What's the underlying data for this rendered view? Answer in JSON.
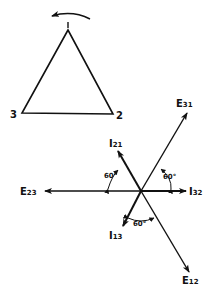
{
  "triangle": {
    "vertex_top_label": "",
    "vertex_left_label": "3",
    "vertex_right_label": "2",
    "rotation": "counter-clockwise"
  },
  "phasors": {
    "E23": {
      "main": "E",
      "sub": "23",
      "angle_deg": 180
    },
    "I32": {
      "main": "I",
      "sub": "32",
      "angle_deg": 0
    },
    "E31": {
      "main": "E",
      "sub": "31",
      "angle_deg": 60
    },
    "E12": {
      "main": "E",
      "sub": "12",
      "angle_deg": -60
    },
    "I21": {
      "main": "I",
      "sub": "21",
      "angle_deg": 120
    },
    "I13": {
      "main": "I",
      "sub": "13",
      "angle_deg": -120
    }
  },
  "angles": {
    "left": "60°",
    "right": "60°",
    "bottom": "60°"
  }
}
